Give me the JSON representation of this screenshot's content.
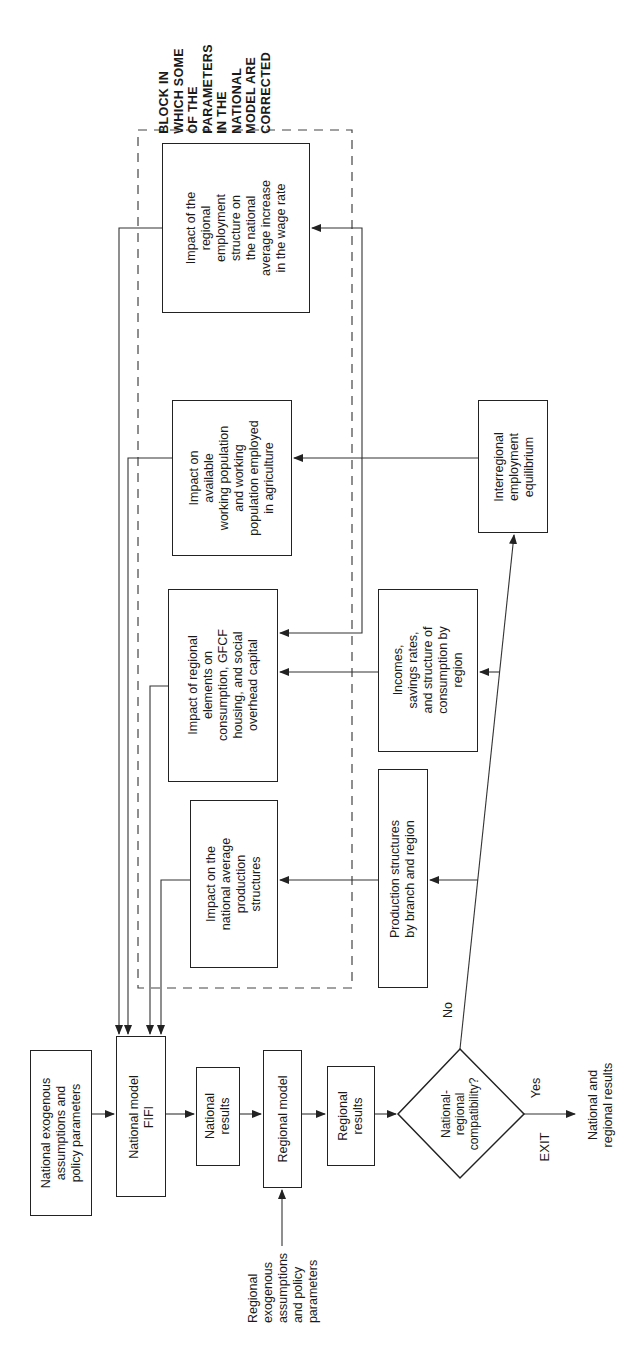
{
  "diagram": {
    "orientation": "rotated-90-ccw",
    "block_caption": "BLOCK IN\nWHICH SOME\nOF THE\nPARAMETERS\nIN THE\nNATIONAL\nMODEL ARE\nCORRECTED",
    "correction_block": {
      "boxes": [
        {
          "id": "wage",
          "text": "Impact of the\nregional\nemployment\nstructure on\nthe national\naverage increase\nin the wage rate"
        },
        {
          "id": "agri",
          "text": "Impact on\navailable\nworking population\nand working\npopulation employed\nin agriculture"
        },
        {
          "id": "cons",
          "text": "Impact of regional\nelements on\nconsumption, GFCF\nhousing, and social\noverhead capital"
        },
        {
          "id": "prodimpact",
          "text": "Impact on the\nnational average\nproduction\nstructures"
        }
      ]
    },
    "regional_boxes": [
      {
        "id": "incomes",
        "text": "Incomes,\nsavings rates,\nand structure of\nconsumption by\nregion"
      },
      {
        "id": "prodstruct",
        "text": "Production structures\nby branch and region"
      },
      {
        "id": "interregional",
        "text": "Interregional\nemployment\nequilibrium"
      }
    ],
    "main_flow": [
      {
        "id": "natexog",
        "text": "National exogenous\nassumptions and\npolicy parameters"
      },
      {
        "id": "natmodel",
        "text": "National model\nFIFI"
      },
      {
        "id": "natresults",
        "text": "National\nresults"
      },
      {
        "id": "regmodel",
        "text": "Regional model"
      },
      {
        "id": "regresults",
        "text": "Regional\nresults"
      }
    ],
    "regional_inputs": "Regional\nexogenous\nassumptions\nand policy\nparameters",
    "decision": {
      "text": "National-\nregional\ncompatibility?",
      "yes_label": "Yes",
      "no_label": "No",
      "exit_label": "EXIT",
      "exit_output": "National and\nregional results"
    }
  }
}
